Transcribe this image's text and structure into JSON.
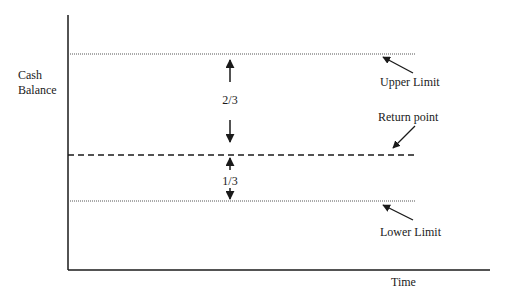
{
  "diagram": {
    "y_axis_label": [
      "Cash",
      "Balance"
    ],
    "x_axis_label": "Time",
    "lines": [
      {
        "id": "upper",
        "label": "Upper Limit",
        "style": "dotted"
      },
      {
        "id": "return",
        "label": "Return point",
        "style": "dashed"
      },
      {
        "id": "lower",
        "label": "Lower Limit",
        "style": "dotted"
      }
    ],
    "spans": [
      {
        "from": "return",
        "to": "upper",
        "label": "2/3"
      },
      {
        "from": "lower",
        "to": "return",
        "label": "1/3"
      }
    ],
    "colors": {
      "ink": "#1a1a1a",
      "dotted": "#555555"
    }
  }
}
